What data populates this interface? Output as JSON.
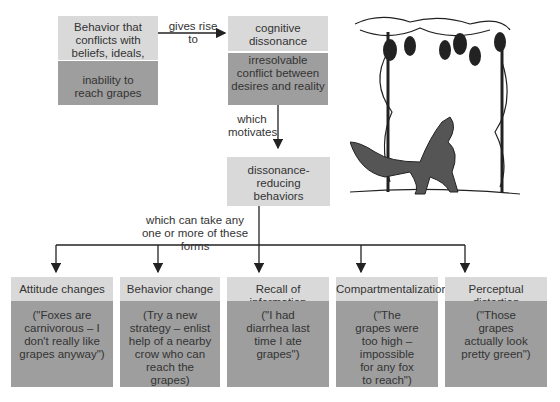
{
  "top_left": {
    "header": "Behavior that conflicts with beliefs, ideals, desires",
    "example": "inability to reach grapes"
  },
  "edge_gives_rise": "gives rise to",
  "top_center": {
    "header": "cognitive dissonance",
    "example": "irresolvable conflict between desires and reality"
  },
  "edge_motivates": "which motivates",
  "middle": {
    "header": "dissonance-reducing behaviors"
  },
  "edge_forms": "which can take any one or more of these forms",
  "forms": [
    {
      "title": "Attitude changes",
      "example": "(\"Foxes are carnivorous – I don't really like grapes anyway\")"
    },
    {
      "title": "Behavior change",
      "example": "(Try a new strategy – enlist help of a nearby crow who can reach the grapes)"
    },
    {
      "title": "Recall of information",
      "example": "(\"I had diarrhea last time I ate grapes\")"
    },
    {
      "title": "Compartmentalization",
      "example": "(\"The grapes were too high – impossible for any fox to reach\")"
    },
    {
      "title": "Perceptual distortion",
      "example": "(\"Those grapes actually look pretty green\")"
    }
  ],
  "illustration": "fox-and-grapes-illustration",
  "colors": {
    "light_box": "#d9d9d9",
    "dark_box": "#9e9e9e",
    "line": "#222222"
  }
}
